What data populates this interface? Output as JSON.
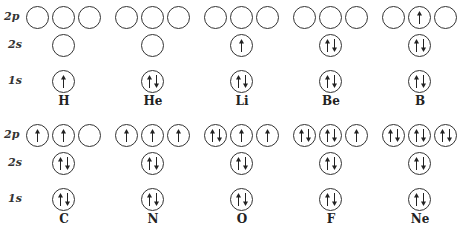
{
  "row_labels": [
    "2p",
    "2s",
    "1s"
  ],
  "arrow_legend": {
    "u": "spin-up electron",
    "d": "spin-down electron"
  },
  "elements": [
    {
      "symbol": "H",
      "orbitals": {
        "1s": "u",
        "2s": "",
        "2p": [
          "",
          "",
          ""
        ]
      }
    },
    {
      "symbol": "He",
      "orbitals": {
        "1s": "ud",
        "2s": "",
        "2p": [
          "",
          "",
          ""
        ]
      }
    },
    {
      "symbol": "Li",
      "orbitals": {
        "1s": "ud",
        "2s": "u",
        "2p": [
          "",
          "",
          ""
        ]
      }
    },
    {
      "symbol": "Be",
      "orbitals": {
        "1s": "ud",
        "2s": "ud",
        "2p": [
          "",
          "",
          ""
        ]
      }
    },
    {
      "symbol": "B",
      "orbitals": {
        "1s": "ud",
        "2s": "ud",
        "2p": [
          "",
          "u",
          ""
        ]
      }
    },
    {
      "symbol": "C",
      "orbitals": {
        "1s": "ud",
        "2s": "ud",
        "2p": [
          "u",
          "u",
          ""
        ]
      }
    },
    {
      "symbol": "N",
      "orbitals": {
        "1s": "ud",
        "2s": "ud",
        "2p": [
          "u",
          "u",
          "u"
        ]
      }
    },
    {
      "symbol": "O",
      "orbitals": {
        "1s": "ud",
        "2s": "ud",
        "2p": [
          "ud",
          "u",
          "u"
        ]
      }
    },
    {
      "symbol": "F",
      "orbitals": {
        "1s": "ud",
        "2s": "ud",
        "2p": [
          "ud",
          "ud",
          "u"
        ]
      }
    },
    {
      "symbol": "Ne",
      "orbitals": {
        "1s": "ud",
        "2s": "ud",
        "2p": [
          "ud",
          "ud",
          "ud"
        ]
      }
    }
  ]
}
